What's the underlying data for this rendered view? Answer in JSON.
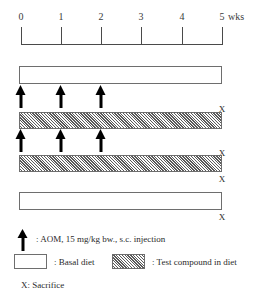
{
  "axis": {
    "ticks": [
      {
        "label": "0",
        "week": 0,
        "x": 21
      },
      {
        "label": "1",
        "week": 1,
        "x": 61
      },
      {
        "label": "2",
        "week": 2,
        "x": 101
      },
      {
        "label": "3",
        "week": 3,
        "x": 141
      },
      {
        "label": "4",
        "week": 4,
        "x": 182
      },
      {
        "label": "5",
        "week": 5,
        "x": 222
      }
    ],
    "units_label": "wks",
    "range": [
      0,
      5
    ],
    "axis_color": "#4a4a4a"
  },
  "groups": [
    {
      "id": "group-1",
      "diet": "basal",
      "bar": {
        "top": 66,
        "height": 18
      },
      "arrow_weeks": [
        0,
        1,
        2
      ],
      "arrows_x": [
        21,
        61,
        101
      ],
      "arrows_top": 85,
      "sacrifice": {
        "label": "X",
        "x": 222,
        "top": 104
      }
    },
    {
      "id": "group-2",
      "diet": "compound",
      "bar": {
        "top": 112,
        "height": 17
      },
      "arrow_weeks": [
        0,
        1,
        2
      ],
      "arrows_x": [
        21,
        61,
        101
      ],
      "arrows_top": 129,
      "sacrifice": {
        "label": "X",
        "x": 222,
        "top": 148
      }
    },
    {
      "id": "group-3",
      "diet": "compound",
      "bar": {
        "top": 155,
        "height": 17
      },
      "arrow_weeks": [],
      "arrows_x": [],
      "arrows_top": 0,
      "sacrifice": {
        "label": "X",
        "x": 222,
        "top": 174
      }
    },
    {
      "id": "group-4",
      "diet": "basal",
      "bar": {
        "top": 192,
        "height": 18
      },
      "arrow_weeks": [],
      "arrows_x": [],
      "arrows_top": 0,
      "sacrifice": {
        "label": "X",
        "x": 222,
        "top": 212
      }
    }
  ],
  "legend": {
    "arrow_text": ": AOM, 15 mg/kg bw., s.c. injection",
    "basal_text": ": Basal diet",
    "compound_text": ": Test compound in diet",
    "sacrifice_text": "X: Sacrifice"
  },
  "colors": {
    "line": "#4a4a4a",
    "bar_border": "#6e6e6e",
    "hatch": "#464646",
    "arrow": "#000000",
    "text": "#2a2a2a",
    "background": "#ffffff"
  }
}
